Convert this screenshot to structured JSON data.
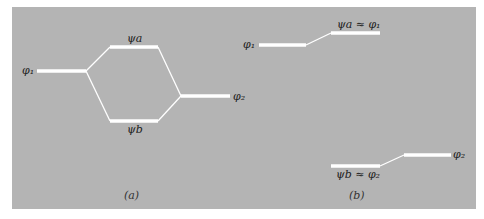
{
  "diagram": {
    "panel_color": "#b4b4b4",
    "line_color": "#ffffff",
    "panels": [
      {
        "caption": "(a)",
        "labels": {
          "phi1": "φ₁",
          "phi2": "φ₂",
          "psi_a": "ψa",
          "psi_b": "ψb"
        }
      },
      {
        "caption": "(b)",
        "labels": {
          "phi1": "φ₁",
          "phi2": "φ₂",
          "psi_a": "ψa ≈ φ₁",
          "psi_b": "ψb ≈ φ₂"
        }
      }
    ]
  }
}
